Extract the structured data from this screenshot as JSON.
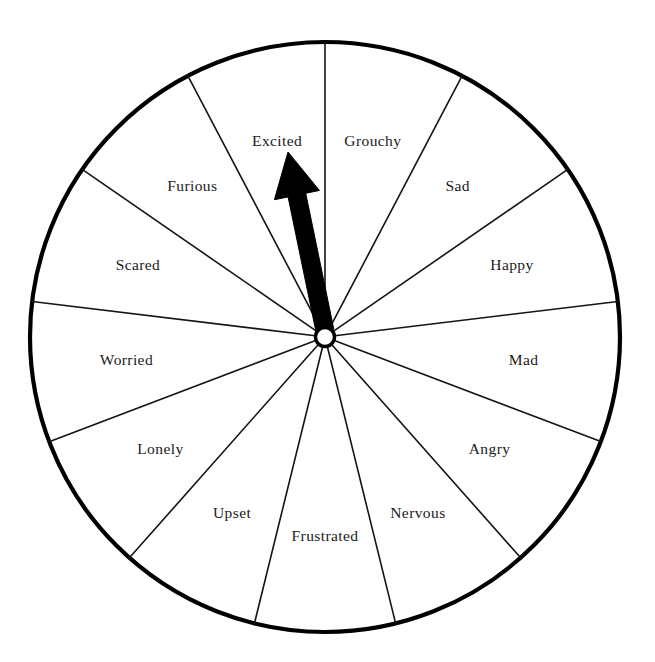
{
  "page": {
    "background_color": "#ffffff",
    "width": 655,
    "height": 662
  },
  "wheel": {
    "center_x": 325,
    "center_y": 337,
    "radius": 295,
    "rim_color": "#000000",
    "spoke_color": "#141414",
    "face_color": "#ffffff",
    "segment_count": 13,
    "segment_angle_deg": 27.692,
    "hub": {
      "outer_radius": 12,
      "inner_radius": 7,
      "color": "#000000",
      "fill": "#ffffff"
    },
    "label_radius": 200,
    "segments": [
      {
        "label": "Excited",
        "center_angle_deg": -13.85
      },
      {
        "label": "Grouchy",
        "center_angle_deg": 13.85
      },
      {
        "label": "Sad",
        "center_angle_deg": 41.54
      },
      {
        "label": "Happy",
        "center_angle_deg": 69.23
      },
      {
        "label": "Mad",
        "center_angle_deg": 96.92
      },
      {
        "label": "Angry",
        "center_angle_deg": 124.62
      },
      {
        "label": "Nervous",
        "center_angle_deg": 152.31
      },
      {
        "label": "Frustrated",
        "center_angle_deg": 180.0
      },
      {
        "label": "Upset",
        "center_angle_deg": 207.69
      },
      {
        "label": "Lonely",
        "center_angle_deg": 235.38
      },
      {
        "label": "Worried",
        "center_angle_deg": 263.08
      },
      {
        "label": "Scared",
        "center_angle_deg": 290.77
      },
      {
        "label": "Furious",
        "center_angle_deg": 318.46
      }
    ]
  },
  "pointer": {
    "name": "spinner-arrow",
    "color": "#000000",
    "direction_deg": -11.5,
    "tip_x": 288,
    "tip_y": 152,
    "base_x": 325,
    "base_y": 331,
    "shaft_half_width": 9,
    "head_half_width": 23,
    "head_length": 44,
    "points_at": "Excited"
  },
  "chart_data": {
    "type": "pie",
    "categories": [
      "Excited",
      "Grouchy",
      "Sad",
      "Happy",
      "Mad",
      "Angry",
      "Nervous",
      "Frustrated",
      "Upset",
      "Lonely",
      "Worried",
      "Scared",
      "Furious"
    ],
    "values": [
      1,
      1,
      1,
      1,
      1,
      1,
      1,
      1,
      1,
      1,
      1,
      1,
      1
    ],
    "slice_angle_deg": 27.692,
    "selected": "Excited",
    "legend": "none",
    "grid": false
  }
}
